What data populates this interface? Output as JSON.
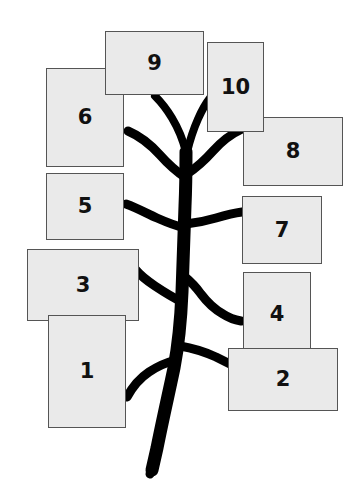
{
  "diagram": {
    "background_color": "#ffffff",
    "tree_color": "#000000",
    "box_fill_color": "#eaeaea",
    "box_border_color": "#555555",
    "label_color": "#111111",
    "nodes": [
      {
        "id": "node-1",
        "label": "1",
        "x": 48,
        "y": 315,
        "w": 78,
        "h": 113,
        "z": 9
      },
      {
        "id": "node-2",
        "label": "2",
        "x": 228,
        "y": 348,
        "w": 110,
        "h": 63,
        "z": 9
      },
      {
        "id": "node-3",
        "label": "3",
        "x": 27,
        "y": 249,
        "w": 112,
        "h": 72,
        "z": 8
      },
      {
        "id": "node-4",
        "label": "4",
        "x": 243,
        "y": 272,
        "w": 68,
        "h": 84,
        "z": 8
      },
      {
        "id": "node-5",
        "label": "5",
        "x": 46,
        "y": 173,
        "w": 78,
        "h": 67,
        "z": 7
      },
      {
        "id": "node-6",
        "label": "6",
        "x": 46,
        "y": 68,
        "w": 78,
        "h": 99,
        "z": 7
      },
      {
        "id": "node-7",
        "label": "7",
        "x": 242,
        "y": 196,
        "w": 80,
        "h": 68,
        "z": 7
      },
      {
        "id": "node-8",
        "label": "8",
        "x": 243,
        "y": 117,
        "w": 100,
        "h": 69,
        "z": 6
      },
      {
        "id": "node-9",
        "label": "9",
        "x": 105,
        "y": 31,
        "w": 99,
        "h": 64,
        "z": 11
      },
      {
        "id": "node-10",
        "label": "10",
        "x": 207,
        "y": 42,
        "w": 57,
        "h": 90,
        "z": 10
      }
    ]
  }
}
